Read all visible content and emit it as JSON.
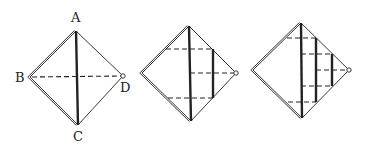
{
  "figure": {
    "colors": {
      "line": "#222222",
      "background": "#ffffff"
    },
    "panels": [
      {
        "id": "step-1",
        "labels": {
          "A": "A",
          "B": "B",
          "C": "C",
          "D": "D"
        },
        "vertices": {
          "top": [
            76,
            31
          ],
          "left": [
            30,
            77
          ],
          "right": [
            123,
            76
          ],
          "bottom": [
            78,
            125
          ]
        },
        "solid_folds": [
          {
            "from": [
              76,
              31
            ],
            "to": [
              78,
              125
            ]
          }
        ],
        "dashed_folds": [
          {
            "from": [
              32,
              77
            ],
            "to": [
              121,
              76
            ]
          }
        ]
      },
      {
        "id": "step-2",
        "vertices": {
          "top": [
            189,
            26
          ],
          "left": [
            142,
            73
          ],
          "right": [
            236,
            73
          ],
          "bottom": [
            191,
            121
          ]
        },
        "solid_folds": [
          {
            "from": [
              189,
              26
            ],
            "to": [
              191,
              121
            ]
          },
          {
            "from": [
              213,
              49
            ],
            "to": [
              213,
              98
            ]
          }
        ],
        "dashed_folds": [
          {
            "from": [
              166,
              49
            ],
            "to": [
              213,
              49
            ]
          },
          {
            "from": [
              190,
              73
            ],
            "to": [
              234,
              73
            ]
          },
          {
            "from": [
              168,
              98
            ],
            "to": [
              213,
              98
            ]
          }
        ]
      },
      {
        "id": "step-3",
        "vertices": {
          "top": [
            301,
            23
          ],
          "left": [
            253,
            70
          ],
          "right": [
            349,
            70
          ],
          "bottom": [
            302,
            118
          ]
        },
        "solid_folds": [
          {
            "from": [
              301,
              23
            ],
            "to": [
              302,
              118
            ]
          },
          {
            "from": [
              316,
              38
            ],
            "to": [
              316,
              102
            ]
          },
          {
            "from": [
              332,
              54
            ],
            "to": [
              332,
              86
            ]
          }
        ],
        "dashed_folds": [
          {
            "from": [
              287,
              38
            ],
            "to": [
              316,
              38
            ]
          },
          {
            "from": [
              301,
              54
            ],
            "to": [
              332,
              54
            ]
          },
          {
            "from": [
              316,
              70
            ],
            "to": [
              347,
              70
            ]
          },
          {
            "from": [
              301,
              86
            ],
            "to": [
              332,
              86
            ]
          },
          {
            "from": [
              288,
              102
            ],
            "to": [
              316,
              102
            ]
          }
        ]
      }
    ]
  }
}
